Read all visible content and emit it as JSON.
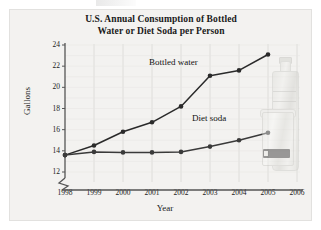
{
  "figure": {
    "title_line1": "U.S. Annual Consumption of Bottled",
    "title_line2": "Water or Diet Soda per Person",
    "photo_alt": "bottled-water-and-diet-soda-photo"
  },
  "chart_data": {
    "type": "line",
    "title": "U.S. Annual Consumption of Bottled Water or Diet Soda per Person",
    "xlabel": "Year",
    "ylabel": "Gallons",
    "x": [
      1998,
      1999,
      2000,
      2001,
      2002,
      2003,
      2004,
      2005
    ],
    "categories": [
      "1998",
      "1999",
      "2000",
      "2001",
      "2002",
      "2003",
      "2004",
      "2005"
    ],
    "xtick_labels": [
      "1998",
      "1999",
      "2000",
      "2001",
      "2002",
      "2003",
      "2004",
      "2005",
      "2006"
    ],
    "ytick_labels": [
      "12",
      "14",
      "16",
      "18",
      "20",
      "22",
      "24"
    ],
    "ytick_values": [
      12,
      14,
      16,
      18,
      20,
      22,
      24
    ],
    "xlim": [
      1998,
      2006
    ],
    "ylim": [
      12,
      24
    ],
    "y_axis_break": true,
    "grid": "vertical-and-horizontal-faint",
    "legend": "inline-labels",
    "series": [
      {
        "name": "Bottled water",
        "label": "Bottled water",
        "color": "#2a2a2a",
        "marker": "filled-circle",
        "values": [
          13.6,
          14.5,
          15.8,
          16.7,
          18.2,
          21.1,
          21.6,
          23.1
        ]
      },
      {
        "name": "Diet soda",
        "label": "Diet soda",
        "color": "#3a3a3a",
        "marker": "filled-circle",
        "values": [
          13.6,
          13.9,
          13.85,
          13.85,
          13.9,
          14.4,
          15.0,
          15.7
        ]
      }
    ]
  },
  "colors": {
    "panel_background": "#f3f2f0",
    "axis": "#555555",
    "gridline": "#d8d8d4",
    "text": "#1a1a1a",
    "bottled_water_line": "#2a2a2a",
    "diet_soda_line": "#3a3a3a"
  }
}
